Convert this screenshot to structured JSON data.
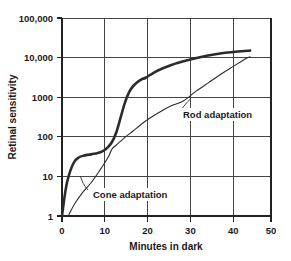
{
  "chart_data": {
    "type": "line",
    "title": "",
    "xlabel": "Minutes in dark",
    "ylabel": "Retinal sensitivity",
    "xlim": [
      0,
      50
    ],
    "ylim": [
      1,
      100000
    ],
    "yscale": "log",
    "grid": true,
    "legend_position": "inline-annotations",
    "x_ticks": [
      0,
      10,
      20,
      30,
      40,
      50
    ],
    "x_tick_labels": [
      "0",
      "10",
      "20",
      "30",
      "40",
      "50"
    ],
    "y_ticks": [
      1,
      10,
      100,
      1000,
      10000,
      100000
    ],
    "y_tick_labels": [
      "1",
      "10",
      "100",
      "1000",
      "10,000",
      "100,000"
    ],
    "series": [
      {
        "name": "Cone adaptation",
        "style": "thick",
        "annotation": "Cone adaptation",
        "x": [
          0,
          0.6,
          1.2,
          2,
          3,
          4,
          5,
          6,
          7,
          8,
          9,
          10,
          11,
          12,
          13,
          14,
          15,
          16,
          17,
          18,
          19,
          20,
          22,
          24,
          26,
          28,
          30,
          33,
          36,
          39,
          42,
          45
        ],
        "y": [
          1,
          3,
          7,
          14,
          24,
          30,
          33,
          35,
          36,
          38,
          40,
          45,
          55,
          75,
          130,
          300,
          700,
          1300,
          1900,
          2400,
          2800,
          3100,
          4200,
          5300,
          6400,
          7500,
          8600,
          10200,
          11800,
          13200,
          14300,
          15000
        ]
      },
      {
        "name": "Rod adaptation",
        "style": "thin",
        "annotation": "Rod adaptation",
        "x": [
          1.5,
          3,
          5,
          7,
          9,
          11,
          12,
          13,
          15,
          17,
          20,
          23,
          26,
          29,
          32,
          35,
          38,
          41,
          44,
          45
        ],
        "y": [
          1,
          2,
          4,
          7,
          14,
          30,
          50,
          62,
          95,
          140,
          250,
          400,
          600,
          800,
          1400,
          2300,
          3800,
          6000,
          9500,
          10500
        ]
      }
    ],
    "annotations": [
      {
        "text": "Cone adaptation",
        "label_x_px": 93,
        "label_y_px": 196,
        "leader_from_px": [
          88,
          190
        ],
        "leader_to_px": [
          80,
          176
        ]
      },
      {
        "text": "Rod adaptation",
        "label_x_px": 182,
        "label_y_px": 116,
        "leader_from_px": [
          180,
          111
        ],
        "leader_to_px": [
          190,
          100
        ]
      }
    ]
  },
  "colors": {
    "background": "#ffffff",
    "grid": "#444444",
    "axis": "#222222",
    "curve": "#2b2b2b",
    "text": "#1a1a1a"
  }
}
